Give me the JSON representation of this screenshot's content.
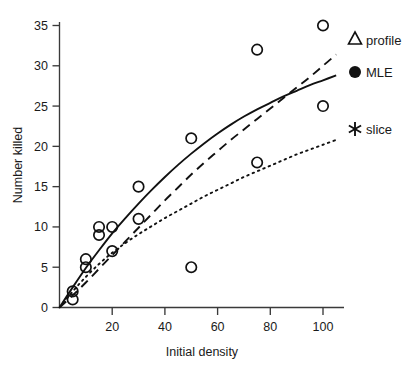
{
  "chart_data": {
    "type": "scatter",
    "title": "",
    "xlabel": "Initial density",
    "ylabel": "Number killed",
    "xlim": [
      0,
      108
    ],
    "ylim": [
      0,
      36.5
    ],
    "grid": false,
    "legend_position": "right",
    "x_ticks": [
      20,
      40,
      60,
      80,
      100
    ],
    "x_tick_labels": [
      "20",
      "40",
      "60",
      "80",
      "100"
    ],
    "y_ticks": [
      0,
      5,
      10,
      15,
      20,
      25,
      30,
      35
    ],
    "y_tick_labels": [
      "0",
      "5",
      "10",
      "15",
      "20",
      "25",
      "30",
      "35"
    ],
    "points": [
      {
        "x": 5,
        "y": 2
      },
      {
        "x": 5,
        "y": 1
      },
      {
        "x": 10,
        "y": 6
      },
      {
        "x": 10,
        "y": 5
      },
      {
        "x": 15,
        "y": 10
      },
      {
        "x": 15,
        "y": 9
      },
      {
        "x": 20,
        "y": 10
      },
      {
        "x": 20,
        "y": 7
      },
      {
        "x": 30,
        "y": 15
      },
      {
        "x": 30,
        "y": 11
      },
      {
        "x": 50,
        "y": 21
      },
      {
        "x": 50,
        "y": 5
      },
      {
        "x": 75,
        "y": 32
      },
      {
        "x": 75,
        "y": 18
      },
      {
        "x": 100,
        "y": 35
      },
      {
        "x": 100,
        "y": 25
      }
    ],
    "point_marker": "open-circle",
    "series": [
      {
        "name": "MLE",
        "style": "solid",
        "marker": "filled-circle",
        "x": [
          0,
          5,
          10,
          15,
          20,
          25,
          30,
          35,
          40,
          45,
          50,
          55,
          60,
          65,
          70,
          75,
          80,
          85,
          90,
          95,
          100,
          105
        ],
        "values": [
          0.0,
          2.5,
          4.9,
          7.1,
          9.2,
          11.1,
          12.9,
          14.6,
          16.2,
          17.7,
          19.1,
          20.4,
          21.6,
          22.7,
          23.7,
          24.6,
          25.4,
          26.2,
          26.9,
          27.6,
          28.2,
          28.8
        ]
      },
      {
        "name": "profile",
        "style": "dashed",
        "marker": "open-triangle",
        "x": [
          0,
          5,
          10,
          15,
          20,
          25,
          30,
          35,
          40,
          45,
          50,
          55,
          60,
          65,
          70,
          75,
          80,
          85,
          90,
          95,
          100,
          105
        ],
        "values": [
          0.0,
          1.5,
          3.1,
          4.8,
          6.5,
          8.2,
          9.9,
          11.6,
          13.3,
          14.9,
          16.5,
          18.0,
          19.4,
          20.8,
          22.1,
          23.4,
          24.7,
          26.0,
          27.3,
          28.6,
          30.0,
          31.4
        ]
      },
      {
        "name": "slice",
        "style": "dotted",
        "marker": "asterisk",
        "x": [
          0,
          5,
          10,
          15,
          20,
          25,
          30,
          35,
          40,
          45,
          50,
          55,
          60,
          65,
          70,
          75,
          80,
          85,
          90,
          95,
          100,
          105
        ],
        "values": [
          0.0,
          2.0,
          3.8,
          5.4,
          6.8,
          8.0,
          9.1,
          10.1,
          11.1,
          12.0,
          12.9,
          13.8,
          14.6,
          15.4,
          16.2,
          16.9,
          17.6,
          18.3,
          19.0,
          19.6,
          20.2,
          20.8
        ]
      }
    ]
  },
  "axes": {
    "x_title": "Initial density",
    "y_title": "Number killed"
  },
  "legend": {
    "entries": [
      {
        "label": "profile",
        "marker": "open-triangle"
      },
      {
        "label": "MLE",
        "marker": "filled-circle"
      },
      {
        "label": "slice",
        "marker": "asterisk"
      }
    ]
  },
  "colors": {
    "ink": "#111111",
    "axis": "#3a3a3a",
    "background": "#ffffff"
  }
}
